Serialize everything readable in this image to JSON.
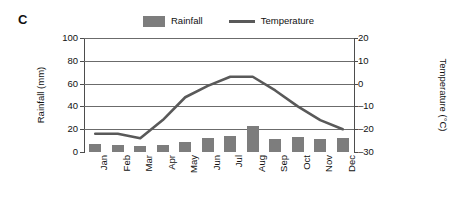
{
  "panel": {
    "label": "C"
  },
  "legend": {
    "position": "top-center",
    "entries": [
      {
        "name": "rainfall",
        "label": "Rainfall",
        "marker": "bar-swatch",
        "color": "#7d7d7d"
      },
      {
        "name": "temperature",
        "label": "Temperature",
        "marker": "line-swatch",
        "color": "#595959"
      }
    ]
  },
  "axes": {
    "left": {
      "title": "Rainfall (mm)",
      "ticks": [
        "0",
        "20",
        "40",
        "60",
        "80",
        "100"
      ],
      "min": 0,
      "max": 100
    },
    "right": {
      "title": "Temperature (°C)",
      "ticks": [
        "-30",
        "-20",
        "-10",
        "0",
        "10",
        "20"
      ],
      "min": -30,
      "max": 20
    },
    "x": {
      "title": "",
      "ticks": [
        "Jan",
        "Feb",
        "Mar",
        "Apr",
        "May",
        "Jun",
        "Jul",
        "Aug",
        "Sep",
        "Oct",
        "Nov",
        "Dec"
      ]
    }
  },
  "chart_data": {
    "type": "bar",
    "title": "C",
    "xlabel": "",
    "ylabel": "Rainfall (mm)",
    "y2label": "Temperature (°C)",
    "ylim": [
      0,
      100
    ],
    "y2lim": [
      -30,
      20
    ],
    "grid": true,
    "legend_position": "top-center",
    "categories": [
      "Jan",
      "Feb",
      "Mar",
      "Apr",
      "May",
      "Jun",
      "Jul",
      "Aug",
      "Sep",
      "Oct",
      "Nov",
      "Dec"
    ],
    "series": [
      {
        "name": "Rainfall",
        "type": "bar",
        "axis": "left",
        "unit": "mm",
        "color": "#7d7d7d",
        "values": [
          7,
          6.5,
          5.5,
          6.5,
          8.5,
          12,
          14,
          23,
          11,
          13,
          11.5,
          12.5
        ]
      },
      {
        "name": "Temperature",
        "type": "line",
        "axis": "right",
        "unit": "°C",
        "color": "#595959",
        "values": [
          -22,
          -22,
          -24,
          -16,
          -6,
          -1,
          3,
          3,
          -3,
          -10,
          -16,
          -20
        ]
      }
    ]
  }
}
